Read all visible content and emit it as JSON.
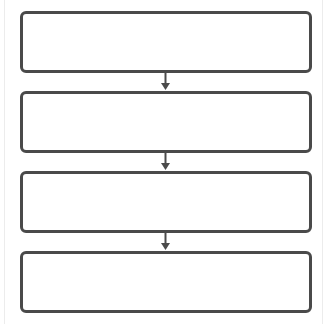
{
  "diagram": {
    "type": "flowchart",
    "orientation": "vertical",
    "title": "",
    "title_note": "truncated at top edge, illegible",
    "colors": {
      "box_border": "#4a4a4a",
      "arrow": "#4a4a4a",
      "background": "#ffffff",
      "frame_line": "#ececec"
    },
    "boxes": [
      {
        "label": ""
      },
      {
        "label": ""
      },
      {
        "label": ""
      },
      {
        "label": ""
      }
    ],
    "arrows": [
      {
        "from": 0,
        "to": 1,
        "icon": "arrow-down-icon"
      },
      {
        "from": 1,
        "to": 2,
        "icon": "arrow-down-icon"
      },
      {
        "from": 2,
        "to": 3,
        "icon": "arrow-down-icon"
      }
    ]
  }
}
